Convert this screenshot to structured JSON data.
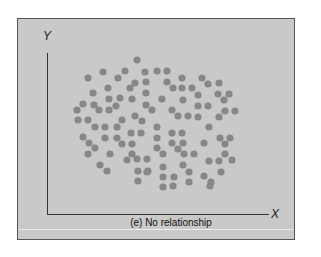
{
  "figure": {
    "caption": "(e) No relationship",
    "y_axis_label": "Y",
    "x_axis_label": "X",
    "colors": {
      "panel_background": "#c9c9c9",
      "dot": "#878787",
      "axis": "#333333"
    }
  },
  "chart_data": {
    "type": "scatter",
    "title": "(e) No relationship",
    "xlabel": "X",
    "ylabel": "Y",
    "grid": false,
    "legend": null,
    "axis_ticks": "none",
    "note": "Points are pixel positions within the figure (x right, y down); no numeric scale shown. Illustrates no relationship between X and Y.",
    "points": [
      [
        137,
        60
      ],
      [
        103,
        72
      ],
      [
        125,
        71
      ],
      [
        88,
        78
      ],
      [
        118,
        78
      ],
      [
        145,
        72
      ],
      [
        157,
        71
      ],
      [
        167,
        71
      ],
      [
        146,
        82
      ],
      [
        135,
        83
      ],
      [
        130,
        88
      ],
      [
        108,
        88
      ],
      [
        167,
        82
      ],
      [
        93,
        93
      ],
      [
        146,
        93
      ],
      [
        120,
        98
      ],
      [
        109,
        99
      ],
      [
        132,
        99
      ],
      [
        162,
        99
      ],
      [
        83,
        104
      ],
      [
        94,
        105
      ],
      [
        116,
        106
      ],
      [
        146,
        105
      ],
      [
        99,
        110
      ],
      [
        109,
        110
      ],
      [
        152,
        110
      ],
      [
        77,
        110
      ],
      [
        135,
        116
      ],
      [
        78,
        120
      ],
      [
        88,
        120
      ],
      [
        122,
        120
      ],
      [
        142,
        121
      ],
      [
        182,
        78
      ],
      [
        202,
        78
      ],
      [
        173,
        88
      ],
      [
        182,
        88
      ],
      [
        192,
        88
      ],
      [
        208,
        84
      ],
      [
        219,
        83
      ],
      [
        198,
        95
      ],
      [
        218,
        94
      ],
      [
        229,
        94
      ],
      [
        224,
        100
      ],
      [
        183,
        100
      ],
      [
        198,
        106
      ],
      [
        208,
        106
      ],
      [
        172,
        110
      ],
      [
        225,
        111
      ],
      [
        235,
        111
      ],
      [
        178,
        116
      ],
      [
        188,
        116
      ],
      [
        198,
        117
      ],
      [
        219,
        117
      ],
      [
        95,
        127
      ],
      [
        105,
        127
      ],
      [
        117,
        127
      ],
      [
        157,
        127
      ],
      [
        83,
        137
      ],
      [
        105,
        138
      ],
      [
        117,
        138
      ],
      [
        131,
        133
      ],
      [
        141,
        133
      ],
      [
        157,
        138
      ],
      [
        89,
        143
      ],
      [
        95,
        148
      ],
      [
        122,
        144
      ],
      [
        132,
        144
      ],
      [
        157,
        148
      ],
      [
        88,
        154
      ],
      [
        110,
        154
      ],
      [
        132,
        154
      ],
      [
        163,
        154
      ],
      [
        127,
        160
      ],
      [
        137,
        159
      ],
      [
        147,
        159
      ],
      [
        100,
        165
      ],
      [
        107,
        171
      ],
      [
        138,
        171
      ],
      [
        148,
        171
      ],
      [
        163,
        167
      ],
      [
        138,
        181
      ],
      [
        163,
        177
      ],
      [
        163,
        187
      ],
      [
        209,
        127
      ],
      [
        172,
        133
      ],
      [
        182,
        133
      ],
      [
        172,
        143
      ],
      [
        183,
        143
      ],
      [
        204,
        143
      ],
      [
        220,
        138
      ],
      [
        230,
        138
      ],
      [
        225,
        144
      ],
      [
        178,
        149
      ],
      [
        184,
        154
      ],
      [
        194,
        154
      ],
      [
        225,
        154
      ],
      [
        209,
        161
      ],
      [
        219,
        161
      ],
      [
        232,
        160
      ],
      [
        183,
        165
      ],
      [
        189,
        172
      ],
      [
        221,
        172
      ],
      [
        174,
        177
      ],
      [
        204,
        176
      ],
      [
        189,
        182
      ],
      [
        211,
        182
      ],
      [
        147,
        172
      ],
      [
        173,
        186
      ],
      [
        210,
        186
      ]
    ]
  }
}
